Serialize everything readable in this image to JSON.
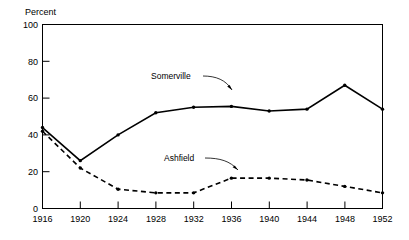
{
  "chart_data": {
    "type": "line",
    "title": "",
    "xlabel": "",
    "ylabel": "Percent",
    "x": [
      1916,
      1920,
      1924,
      1928,
      1932,
      1936,
      1940,
      1944,
      1948,
      1952
    ],
    "xtick_labels": [
      "1916",
      "1920",
      "1924",
      "1928",
      "1932",
      "1936",
      "1940",
      "1944",
      "1948",
      "1952"
    ],
    "ytick_labels": [
      "0",
      "20",
      "40",
      "60",
      "80",
      "100"
    ],
    "yticks": [
      0,
      20,
      40,
      60,
      80,
      100
    ],
    "xlim": [
      1916,
      1952
    ],
    "ylim": [
      0,
      100
    ],
    "grid": false,
    "legend_position": "inline-annotations",
    "series": [
      {
        "name": "Somerville",
        "style": "solid",
        "marker": "dot",
        "values": [
          44,
          26,
          40,
          52,
          55,
          55.5,
          53,
          54,
          67,
          54
        ]
      },
      {
        "name": "Ashfield",
        "style": "dashed",
        "marker": "dot",
        "values": [
          42,
          22,
          10.5,
          8.5,
          8.5,
          16.5,
          16.5,
          15.5,
          12,
          8.5
        ]
      }
    ],
    "annotations": [
      {
        "text": "Somerville",
        "points_to_series": "Somerville"
      },
      {
        "text": "Ashfield",
        "points_to_series": "Ashfield"
      }
    ],
    "colors": {
      "axis": "#000000",
      "somerville": "#000000",
      "ashfield": "#000000",
      "background": "#ffffff"
    }
  }
}
